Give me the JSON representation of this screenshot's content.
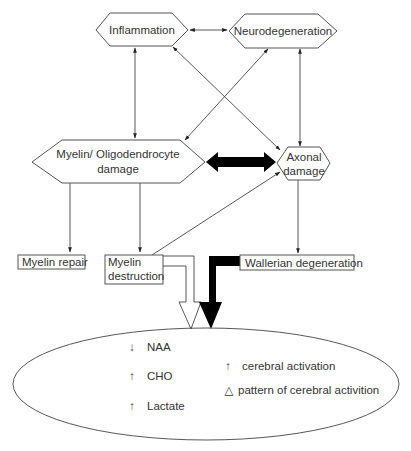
{
  "diagram": {
    "nodes": {
      "inflammation": {
        "label": "Inflammation",
        "shape": "hexagon"
      },
      "neurodegeneration": {
        "label": "Neurodegeneration",
        "shape": "hexagon"
      },
      "myelin_damage": {
        "label_line1": "Myelin/ Oligodendrocyte",
        "label_line2": "damage",
        "shape": "hexagon"
      },
      "axonal_damage": {
        "label_line1": "Axonal",
        "label_line2": "damage",
        "shape": "hexagon"
      },
      "myelin_repair": {
        "label": "Myelin repair",
        "shape": "rectangle"
      },
      "myelin_destruction": {
        "label_line1": "Myelin",
        "label_line2": "destruction",
        "shape": "rectangle"
      },
      "wallerian_degeneration": {
        "label": "Wallerian degeneration",
        "shape": "rectangle"
      }
    },
    "edges": [
      {
        "from": "inflammation",
        "to": "neurodegeneration",
        "type": "bidirectional"
      },
      {
        "from": "inflammation",
        "to": "myelin_damage",
        "type": "bidirectional"
      },
      {
        "from": "inflammation",
        "to": "axonal_damage",
        "type": "bidirectional"
      },
      {
        "from": "neurodegeneration",
        "to": "myelin_damage",
        "type": "bidirectional"
      },
      {
        "from": "neurodegeneration",
        "to": "axonal_damage",
        "type": "bidirectional"
      },
      {
        "from": "myelin_damage",
        "to": "axonal_damage",
        "type": "bidirectional-thick-black"
      },
      {
        "from": "myelin_damage",
        "to": "myelin_repair",
        "type": "directed"
      },
      {
        "from": "myelin_damage",
        "to": "myelin_destruction",
        "type": "directed"
      },
      {
        "from": "myelin_destruction",
        "to": "axonal_damage",
        "type": "directed"
      },
      {
        "from": "axonal_damage",
        "to": "wallerian_degeneration",
        "type": "directed"
      },
      {
        "from": "myelin_destruction",
        "to": "outcome_ellipse",
        "type": "hollow-block-arrow"
      },
      {
        "from": "wallerian_degeneration",
        "to": "outcome_ellipse",
        "type": "solid-block-arrow"
      }
    ],
    "outcome_ellipse": {
      "left_column": [
        {
          "arrow": "↓",
          "label": "NAA"
        },
        {
          "arrow": "↑",
          "label": "CHO"
        },
        {
          "arrow": "↑",
          "label": "Lactate"
        }
      ],
      "right_column": [
        {
          "symbol": "↑",
          "label": "cerebral activation"
        },
        {
          "symbol": "△",
          "label": "pattern of cerebral activition"
        }
      ]
    },
    "colors": {
      "stroke": "#555555",
      "text": "#333333",
      "solid_arrow": "#000000",
      "background": "#ffffff"
    }
  }
}
